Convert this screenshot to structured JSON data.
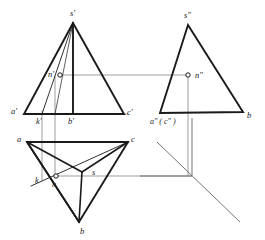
{
  "figure": {
    "type": "descriptive-geometry-projection",
    "colors": {
      "solid_line": "#1a1a1a",
      "projection_line": "#8c8c8c",
      "axis_line": "#6e6e6e",
      "background": "#ffffff",
      "marker_fill": "#ffffff"
    },
    "stroke_widths": {
      "solid": 1.9,
      "thin": 0.9,
      "projection": 0.8
    }
  },
  "views": {
    "front": {
      "name": "front-view",
      "outline": [
        [
          73,
          23
        ],
        [
          24,
          114
        ],
        [
          124,
          114
        ]
      ],
      "axis_vertical": [
        [
          73,
          23
        ],
        [
          73,
          114
        ]
      ],
      "edge_to_k": [
        [
          73,
          23
        ],
        [
          42,
          114
        ]
      ],
      "labels": [
        {
          "id": "s-prime",
          "text": "s'",
          "x": 70,
          "y": 16
        },
        {
          "id": "a-prime",
          "text": "a'",
          "x": 11,
          "y": 114
        },
        {
          "id": "c-prime",
          "text": "c'",
          "x": 127,
          "y": 115
        },
        {
          "id": "k-prime",
          "text": "k'",
          "x": 36,
          "y": 124
        },
        {
          "id": "b-prime",
          "text": "b'",
          "x": 68,
          "y": 124
        },
        {
          "id": "n-prime",
          "text": "n'",
          "x": 49,
          "y": 76
        }
      ],
      "point_n": {
        "x": 60,
        "y": 75,
        "r": 2.2
      }
    },
    "side": {
      "name": "side-view",
      "outline": [
        [
          188,
          25
        ],
        [
          160,
          113
        ],
        [
          243,
          112
        ]
      ],
      "labels": [
        {
          "id": "s-double-prime",
          "text": "s\"",
          "x": 184,
          "y": 18
        },
        {
          "id": "a-c-double-prime",
          "text": "a\" ( c\" )",
          "x": 152,
          "y": 123
        },
        {
          "id": "b-side",
          "text": "b",
          "x": 247,
          "y": 117
        },
        {
          "id": "n-double-prime",
          "text": "n\"",
          "x": 196,
          "y": 77
        }
      ],
      "point_n": {
        "x": 188,
        "y": 75,
        "r": 2.2
      }
    },
    "top": {
      "name": "top-view",
      "outline": [
        [
          27,
          142
        ],
        [
          128,
          142
        ],
        [
          79,
          222
        ]
      ],
      "spokes": [
        [
          [
            27,
            142
          ],
          [
            82,
            172
          ]
        ],
        [
          [
            128,
            142
          ],
          [
            82,
            172
          ]
        ],
        [
          [
            79,
            222
          ],
          [
            82,
            172
          ]
        ]
      ],
      "edge_k_c": [
        [
          33,
          183
        ],
        [
          128,
          142
        ]
      ],
      "edge_a_b": [
        [
          27,
          142
        ],
        [
          79,
          222
        ]
      ],
      "labels": [
        {
          "id": "a-top",
          "text": "a",
          "x": 18,
          "y": 141
        },
        {
          "id": "c-top",
          "text": "c",
          "x": 131,
          "y": 141
        },
        {
          "id": "b-top",
          "text": "b",
          "x": 81,
          "y": 233
        },
        {
          "id": "s-top",
          "text": "s",
          "x": 93,
          "y": 174
        },
        {
          "id": "k-top",
          "text": "k",
          "x": 36,
          "y": 182
        },
        {
          "id": "n-top",
          "text": "n",
          "x": 53,
          "y": 186
        }
      ],
      "point_n": {
        "x": 56,
        "y": 176,
        "r": 2.2
      }
    }
  },
  "projection_lines": [
    {
      "id": "n-horizontal-link",
      "from": [
        60,
        75
      ],
      "to": [
        188,
        75
      ]
    },
    {
      "id": "n-vertical-link",
      "from": [
        55,
        75
      ],
      "to": [
        55,
        177
      ]
    },
    {
      "id": "k-vertical-link",
      "from": [
        42,
        114
      ],
      "to": [
        42,
        179
      ]
    },
    {
      "id": "n-side-vertical",
      "from": [
        188,
        75
      ],
      "to": [
        188,
        176
      ]
    },
    {
      "id": "n-top-horizontal",
      "from": [
        56,
        176
      ],
      "to": [
        192,
        176
      ]
    },
    {
      "id": "front-base-extension",
      "from": [
        24,
        114
      ],
      "to": [
        128,
        114
      ]
    },
    {
      "id": "top-upper-edge",
      "from": [
        27,
        142
      ],
      "to": [
        128,
        142
      ]
    }
  ],
  "axis": {
    "name": "reference-axis",
    "vertical": {
      "from": [
        192,
        118
      ],
      "to": [
        192,
        176
      ]
    },
    "horizontal": {
      "from": [
        140,
        176
      ],
      "to": [
        192,
        176
      ]
    },
    "diagonal": {
      "from": [
        157,
        142
      ],
      "to": [
        240,
        222
      ]
    }
  },
  "markers": {
    "point_style": "small open circle",
    "radius": 2.2
  }
}
